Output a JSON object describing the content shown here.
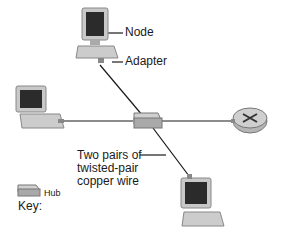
{
  "labels": {
    "node": "Node",
    "adapter": "Adapter",
    "wire_line1": "Two pairs of",
    "wire_line2": "twisted-pair",
    "wire_line3": "copper wire"
  },
  "key": {
    "title": "Key:",
    "hub_label": "Hub"
  },
  "colors": {
    "line": "#1a1a1a",
    "monitor_frame": "#c8c8c8",
    "screen": "#2b2b2b",
    "hub": "#a9a9a9",
    "router": "#b5b5b5"
  }
}
